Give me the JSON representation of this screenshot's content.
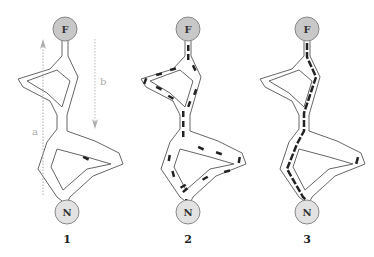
{
  "figure": {
    "panels": [
      {
        "id": "panel-1",
        "label": "1",
        "top_node": "F",
        "bottom_node": "N",
        "description": "empty tube network with axes a and b, single particle"
      },
      {
        "id": "panel-2",
        "label": "2",
        "top_node": "F",
        "bottom_node": "N",
        "description": "particles distributed throughout all tube branches"
      },
      {
        "id": "panel-3",
        "label": "3",
        "top_node": "F",
        "bottom_node": "N",
        "description": "particles concentrated along shortest path"
      }
    ],
    "axes": {
      "a": {
        "label": "a",
        "direction": "up"
      },
      "b": {
        "label": "b",
        "direction": "down"
      }
    },
    "colors": {
      "top_node_fill": "#c8c8c8",
      "bottom_node_fill": "#e2e2e2",
      "node_stroke": "#888888",
      "tube_stroke": "#555555",
      "particle": "#222222",
      "axis": "#aaaaaa"
    }
  }
}
